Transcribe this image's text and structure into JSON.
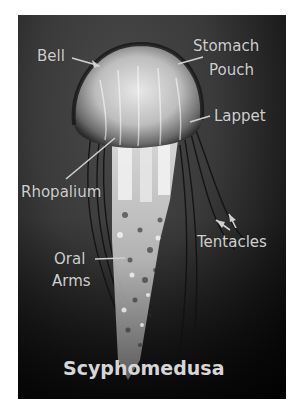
{
  "diagram": {
    "title": "Scyphomedusa",
    "labels": {
      "bell": "Bell",
      "stomach_pouch_line1": "Stomach",
      "stomach_pouch_line2": "Pouch",
      "lappet": "Lappet",
      "rhopalium": "Rhopalium",
      "tentacles": "Tentacles",
      "oral_arms_line1": "Oral",
      "oral_arms_line2": "Arms"
    },
    "colors": {
      "background": "#3a3a3a",
      "label_text": "#cfcfcf",
      "pointer_line": "#d0d0d0"
    }
  }
}
